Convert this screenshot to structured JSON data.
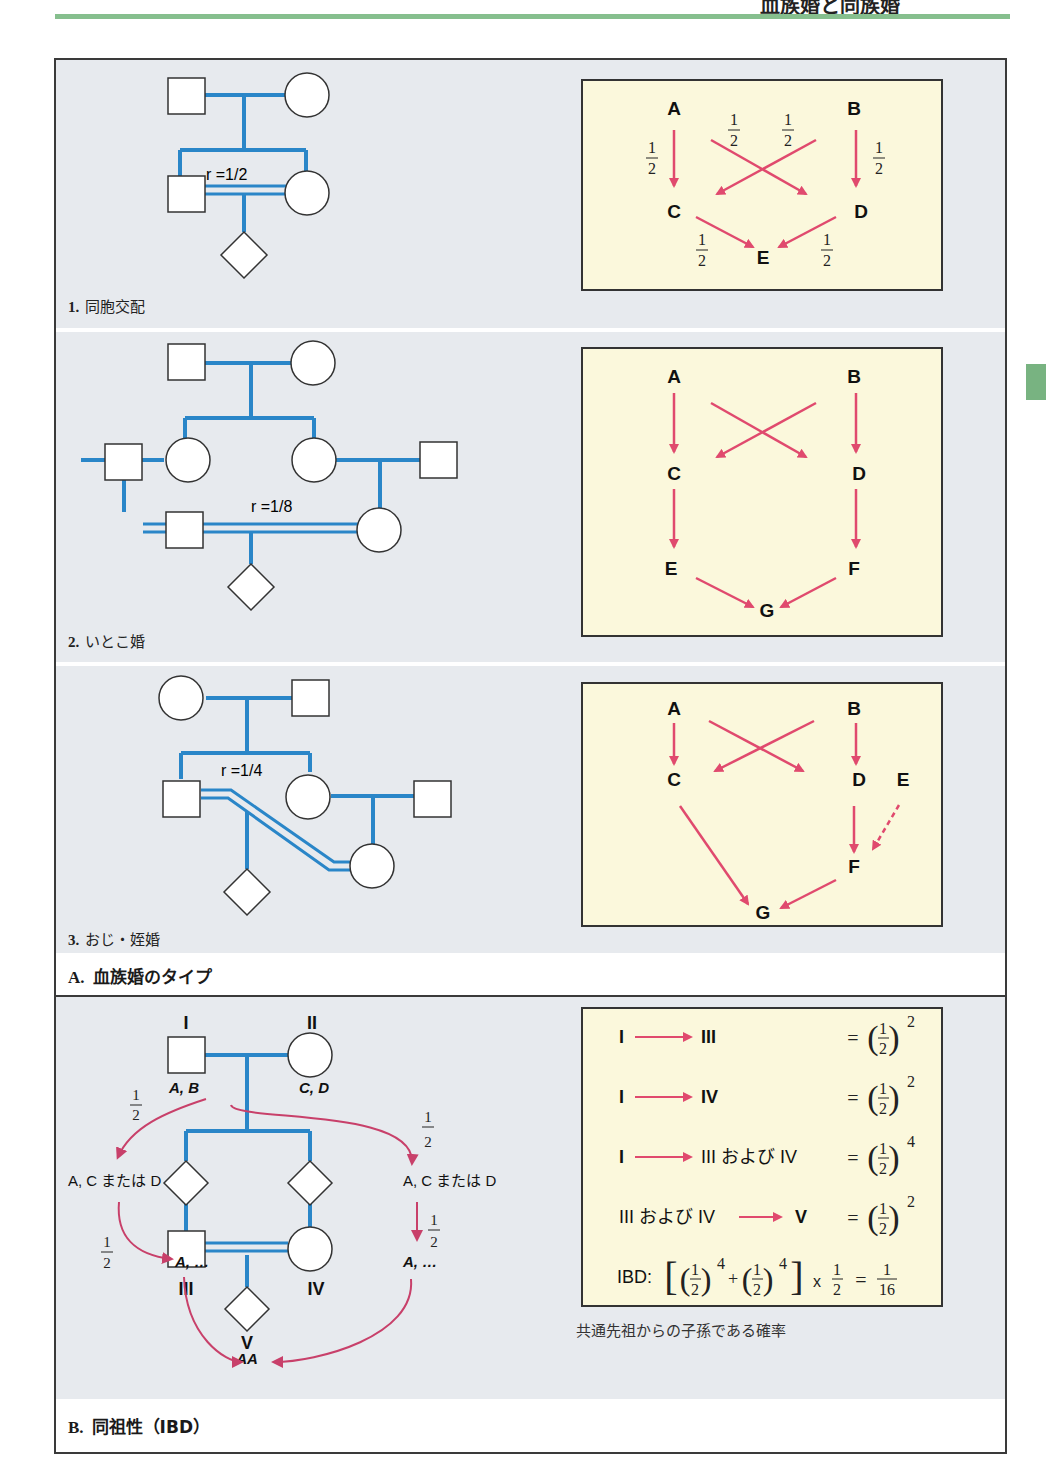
{
  "page": {
    "header_title": "血族婚と同族婚",
    "colors": {
      "pedigree_line": "#2a86c8",
      "arrow": "#e04a6e",
      "ibd_arrow": "#c8406a",
      "panel_bg": "#e7eaee",
      "box_bg": "#fbf8dc",
      "header_rule": "#86bf8e",
      "side_tab": "#78b381"
    }
  },
  "section_a": {
    "caption_num": "A.",
    "caption_text": "血族婚のタイプ",
    "panels": [
      {
        "num": "1.",
        "label": "同胞交配",
        "r_label": "r =1/2",
        "path_nodes": [
          "A",
          "B",
          "C",
          "D",
          "E"
        ],
        "path_fractions": [
          "1",
          "2"
        ]
      },
      {
        "num": "2.",
        "label": "いとこ婚",
        "r_label": "r =1/8",
        "path_nodes": [
          "A",
          "B",
          "C",
          "D",
          "E",
          "F",
          "G"
        ]
      },
      {
        "num": "3.",
        "label": "おじ・姪婚",
        "r_label": "r =1/4",
        "path_nodes": [
          "A",
          "B",
          "C",
          "D",
          "E",
          "F",
          "G"
        ]
      }
    ]
  },
  "section_b": {
    "caption_num": "B.",
    "caption_text": "同祖性（IBD）",
    "generations": [
      "I",
      "II",
      "III",
      "IV",
      "V"
    ],
    "genotypes": {
      "I": "A, B",
      "II": "C, D",
      "left_mid": "A, C または D",
      "right_mid": "A, C または D",
      "III": "A, …",
      "IV": "A, …",
      "V": "AA"
    },
    "fraction_num": "1",
    "fraction_den": "2",
    "equations": [
      {
        "lhs_from": "I",
        "lhs_to": "III",
        "rhs_exp": "2"
      },
      {
        "lhs_from": "I",
        "lhs_to": "IV",
        "rhs_exp": "2"
      },
      {
        "lhs_from": "I",
        "lhs_to": "III および IV",
        "rhs_exp": "4"
      },
      {
        "lhs_from": "III および IV",
        "lhs_to": "V",
        "rhs_exp": "2"
      }
    ],
    "ibd_label": "IBD:",
    "ibd_exp": "4",
    "ibd_times": "x",
    "ibd_result_num": "1",
    "ibd_result_den": "16",
    "footnote": "共通先祖からの子孫である確率"
  }
}
